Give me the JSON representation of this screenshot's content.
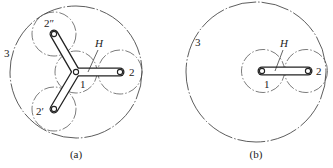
{
  "figure_a": {
    "caption": "(a)",
    "labels": {
      "ring_gear": "3",
      "sun_gear": "1",
      "planet_right": "2",
      "planet_top": "2″",
      "planet_bottom": "2′",
      "carrier": "H"
    },
    "description": "Planetary gear train with three planets (2, 2′, 2″) on a Y-shaped carrier H around sun gear 1 inside ring gear 3"
  },
  "figure_b": {
    "caption": "(b)",
    "labels": {
      "ring_gear": "3",
      "sun_gear": "1",
      "planet": "2",
      "carrier": "H"
    },
    "description": "Planetary gear train with a single planet 2 on straight carrier H, sun gear 1 offset inside ring gear 3"
  },
  "colors": {
    "line": "#222222",
    "background": "#ffffff"
  }
}
